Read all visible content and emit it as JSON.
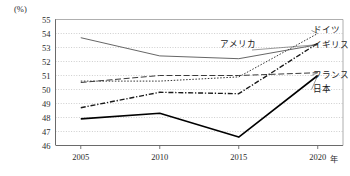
{
  "chart_data": {
    "type": "line",
    "title": "",
    "subtitle": "",
    "unit_label": "(%)",
    "xlabel": "年",
    "ylabel": "",
    "x": [
      2005,
      2010,
      2015,
      2020
    ],
    "xtick_labels": [
      "2005",
      "2010",
      "2015",
      "2020"
    ],
    "ytick_labels": [
      "46",
      "47",
      "48",
      "49",
      "50",
      "51",
      "52",
      "53",
      "54",
      "55"
    ],
    "yticks": [
      46,
      47,
      48,
      49,
      50,
      51,
      52,
      53,
      54,
      55
    ],
    "ylim": [
      46,
      55
    ],
    "xlim": [
      2003.4,
      2021.6
    ],
    "grid": true,
    "grid_style": "dotted-horizontal",
    "legend_position": "inline-right-end-labels",
    "series": [
      {
        "name": "ドイツ",
        "label": "ドイツ",
        "values": [
          50.6,
          50.6,
          50.9,
          54.0
        ],
        "style": "dotted",
        "color": "#333333",
        "width": 1.0,
        "label_x": 313,
        "label_y": 33
      },
      {
        "name": "イギリス",
        "label": "イギリス",
        "values": [
          48.7,
          49.8,
          49.7,
          53.3
        ],
        "style": "dash-dot",
        "color": "#1a1a1a",
        "width": 1.4,
        "label_x": 313,
        "label_y": 48
      },
      {
        "name": "アメリカ",
        "label": "アメリカ",
        "values": [
          53.7,
          52.4,
          52.2,
          53.2
        ],
        "style": "solid",
        "color": "#555555",
        "width": 0.9,
        "label_x": 238,
        "label_y": 47
      },
      {
        "name": "フランス",
        "label": "フランス",
        "values": [
          50.5,
          51.0,
          51.0,
          51.2
        ],
        "style": "long-dash",
        "color": "#3a3a3a",
        "width": 1.0,
        "label_x": 313,
        "label_y": 78
      },
      {
        "name": "日本",
        "label": "日本",
        "values": [
          47.9,
          48.3,
          46.6,
          51.0
        ],
        "style": "solid-thick",
        "color": "#000000",
        "width": 1.6,
        "label_x": 313,
        "label_y": 92
      }
    ]
  }
}
